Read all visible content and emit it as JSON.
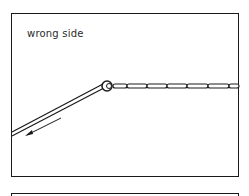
{
  "panel": {
    "label": "wrong side"
  },
  "colors": {
    "ink": "#1a1a1a",
    "background": "#ffffff"
  }
}
